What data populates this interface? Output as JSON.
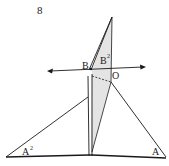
{
  "figure": {
    "number": "8",
    "labels": {
      "B": "B",
      "B2": "B",
      "B2_sup": "2",
      "O": "O",
      "A": "A",
      "A2": "A",
      "A2_sup": "2"
    },
    "colors": {
      "stroke": "#1a1a1a",
      "shade": "#e4e4e4",
      "background": "#ffffff"
    }
  }
}
